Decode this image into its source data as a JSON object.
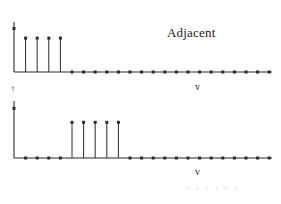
{
  "figure": {
    "width": 281,
    "height": 204,
    "background": "#ffffff",
    "ink_color": "#2b2b2b",
    "faint_color": "#9a9a9a"
  },
  "annotations": {
    "adjacent_label": "Adjacent",
    "axis_label_top": "v",
    "axis_label_bottom": "v",
    "ellipsis": "· · · · · ·",
    "origin_tick_top": "†"
  },
  "chart_data": [
    {
      "type": "line",
      "name": "top-spectrum",
      "title": "Adjacent",
      "xlabel": "v",
      "ylabel": "",
      "grid": false,
      "legend": "none",
      "marker": "filled-square",
      "stem_plot": true,
      "axis": {
        "x_start_px": 14,
        "x_end_px": 272,
        "baseline_px": 72,
        "y_axis_top_px": 22,
        "x_step_px": 11.6
      },
      "xlim": [
        0,
        22
      ],
      "ylim": [
        0,
        1.15
      ],
      "x": [
        0,
        1,
        2,
        3,
        4,
        5,
        6,
        7,
        8,
        9,
        10,
        11,
        12,
        13,
        14,
        15,
        16,
        17,
        18,
        19,
        20,
        21,
        22
      ],
      "values": [
        1.0,
        0.78,
        0.78,
        0.78,
        0.78,
        0,
        0,
        0,
        0,
        0,
        0,
        0,
        0,
        0,
        0,
        0,
        0,
        0,
        0,
        0,
        0,
        0,
        0
      ],
      "annotation_points": [
        {
          "x": 0,
          "y": 1.0,
          "note": "tallest-stem-on-y-axis"
        },
        {
          "x": 4,
          "y": 0.78,
          "note": "last-tall-stem"
        }
      ]
    },
    {
      "type": "line",
      "name": "bottom-spectrum",
      "title": "",
      "xlabel": "v",
      "ylabel": "",
      "grid": false,
      "legend": "none",
      "marker": "filled-square",
      "stem_plot": true,
      "axis": {
        "x_start_px": 14,
        "x_end_px": 272,
        "baseline_px": 158,
        "y_axis_top_px": 101,
        "x_step_px": 11.6
      },
      "xlim": [
        0,
        22
      ],
      "ylim": [
        0,
        1.15
      ],
      "x": [
        0,
        1,
        2,
        3,
        4,
        5,
        6,
        7,
        8,
        9,
        10,
        11,
        12,
        13,
        14,
        15,
        16,
        17,
        18,
        19,
        20,
        21,
        22
      ],
      "values": [
        1.0,
        0,
        0,
        0,
        0,
        0.72,
        0.72,
        0.72,
        0.72,
        0.72,
        0,
        0,
        0,
        0,
        0,
        0,
        0,
        0,
        0,
        0,
        0,
        0,
        0
      ],
      "annotation_points": [
        {
          "x": 0,
          "y": 1.0,
          "note": "tallest-stem-on-y-axis"
        },
        {
          "x": 5,
          "y": 0.72,
          "note": "first-tall-stem-offset"
        },
        {
          "x": 9,
          "y": 0.72,
          "note": "last-tall-stem-offset"
        }
      ]
    }
  ]
}
